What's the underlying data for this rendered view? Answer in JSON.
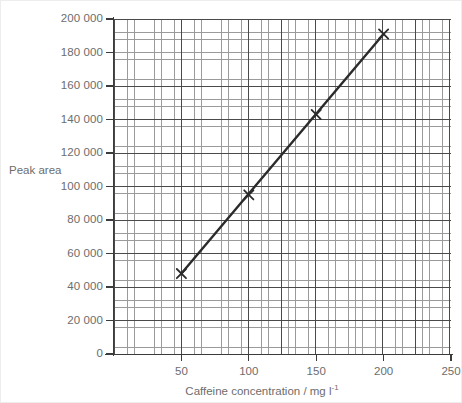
{
  "chart_data": {
    "type": "scatter",
    "title": "",
    "xlabel": "Caffeine concentration / mg l",
    "xlabel_sup": "-1",
    "ylabel": "Peak area",
    "xlim": [
      0,
      250
    ],
    "ylim": [
      0,
      200000
    ],
    "grid": true,
    "grid_style": "graph-paper, minor squares with major lines every 5 squares",
    "legend": "none",
    "marker": "x-cross",
    "line": "best-fit straight line through points",
    "x_ticks": [
      50,
      100,
      150,
      200,
      250
    ],
    "x_tick_labels": [
      "50",
      "100",
      "150",
      "200",
      "250"
    ],
    "y_ticks": [
      0,
      20000,
      40000,
      60000,
      80000,
      100000,
      120000,
      140000,
      160000,
      180000,
      200000
    ],
    "y_tick_labels": [
      "0",
      "20 000",
      "40 000",
      "60 000",
      "80 000",
      "100 000",
      "120 000",
      "140 000",
      "160 000",
      "180 000",
      "200 000"
    ],
    "x": [
      50,
      100,
      150,
      200
    ],
    "values": [
      48000,
      95000,
      143000,
      191000
    ],
    "points": [
      {
        "x": 50,
        "y": 48000
      },
      {
        "x": 100,
        "y": 95000
      },
      {
        "x": 150,
        "y": 143000
      },
      {
        "x": 200,
        "y": 191000
      }
    ],
    "colors": {
      "line": "#2b2b2b",
      "marker": "#2b2b2b",
      "grid_minor": "#9a9a9a",
      "grid_major": "#4a4a4a",
      "axis": "#3b3b3b",
      "text": "#6d6d6d",
      "background": "#ffffff"
    }
  }
}
